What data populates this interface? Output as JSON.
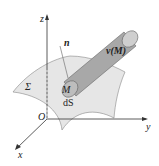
{
  "diagram": {
    "labels": {
      "z_axis": "z",
      "y_axis": "y",
      "x_axis": "x",
      "origin": "O",
      "normal": "n",
      "surface": "Σ",
      "point": "M",
      "area_element": "dS",
      "vector": "v(M)"
    },
    "colors": {
      "surface_fill": "#e6e6e6",
      "cylinder_fill": "#a8a8a8",
      "cylinder_end": "#cfcfcf",
      "axis": "#333333"
    }
  }
}
